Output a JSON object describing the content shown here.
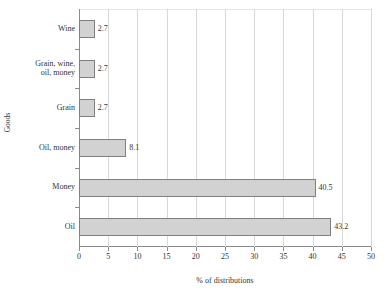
{
  "chart_data": {
    "type": "bar",
    "orientation": "horizontal",
    "title": "",
    "xlabel": "% of distributions",
    "ylabel": "Goods",
    "xlim": [
      0,
      50
    ],
    "xticks": [
      0,
      5,
      10,
      15,
      20,
      25,
      30,
      35,
      40,
      45,
      50
    ],
    "grid": "vertical",
    "legend": "none",
    "categories": [
      "Oil",
      "Money",
      "Oil, money",
      "Grain",
      "Grain, wine,\noil, money",
      "Wine"
    ],
    "values": [
      43.2,
      40.5,
      8.1,
      2.7,
      2.7,
      2.7
    ],
    "value_labels": [
      "43.2",
      "40.5",
      "8.1",
      "2.7",
      "2.7",
      "2.7"
    ],
    "bar_fill": "#d2d2d2",
    "bar_border": "#808080",
    "axis_color": "#8a8a8a",
    "gridline_color": "#d8d8d8"
  }
}
